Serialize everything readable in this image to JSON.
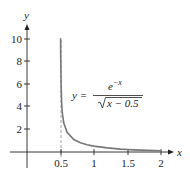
{
  "chart_data": {
    "type": "line",
    "title": "",
    "xlabel": "x",
    "ylabel": "y",
    "xlim": [
      0,
      2.15
    ],
    "ylim": [
      0,
      11
    ],
    "grid": false,
    "x_ticks": [
      0.5,
      1,
      1.5,
      2
    ],
    "x_tick_labels": [
      "0.5",
      "1",
      "1.5",
      "2"
    ],
    "y_ticks": [
      2,
      4,
      6,
      8,
      10
    ],
    "y_tick_labels": [
      "2",
      "4",
      "6",
      "8",
      "10"
    ],
    "asymptote": {
      "x": 0.5,
      "style": "dashed"
    },
    "series": [
      {
        "name": "y = e^(-x) / sqrt(x - 0.5)",
        "color": "#777777",
        "x": [
          0.5036,
          0.505,
          0.51,
          0.52,
          0.53,
          0.55,
          0.6,
          0.7,
          0.8,
          0.9,
          1.0,
          1.2,
          1.4,
          1.5,
          1.6,
          1.8,
          2.0
        ],
        "y": [
          10.07,
          8.51,
          6.0,
          4.2,
          3.39,
          2.58,
          1.74,
          1.11,
          0.82,
          0.64,
          0.52,
          0.36,
          0.26,
          0.22,
          0.19,
          0.14,
          0.11
        ]
      }
    ],
    "annotations": [
      {
        "text": "y = e^{-x} / √(x − 0.5)",
        "position": "upper right of curve"
      }
    ]
  },
  "labels": {
    "x_axis": "x",
    "y_axis": "y",
    "eq_lhs": "y =",
    "eq_num_base": "e",
    "eq_num_exp": "−x",
    "eq_den": "x − 0.5",
    "xt0": "0.5",
    "xt1": "1",
    "xt2": "1.5",
    "xt3": "2",
    "yt0": "2",
    "yt1": "4",
    "yt2": "6",
    "yt3": "8",
    "yt4": "10"
  },
  "colors": {
    "axis": "#222222",
    "curve": "#777777",
    "asymptote": "#888888"
  }
}
